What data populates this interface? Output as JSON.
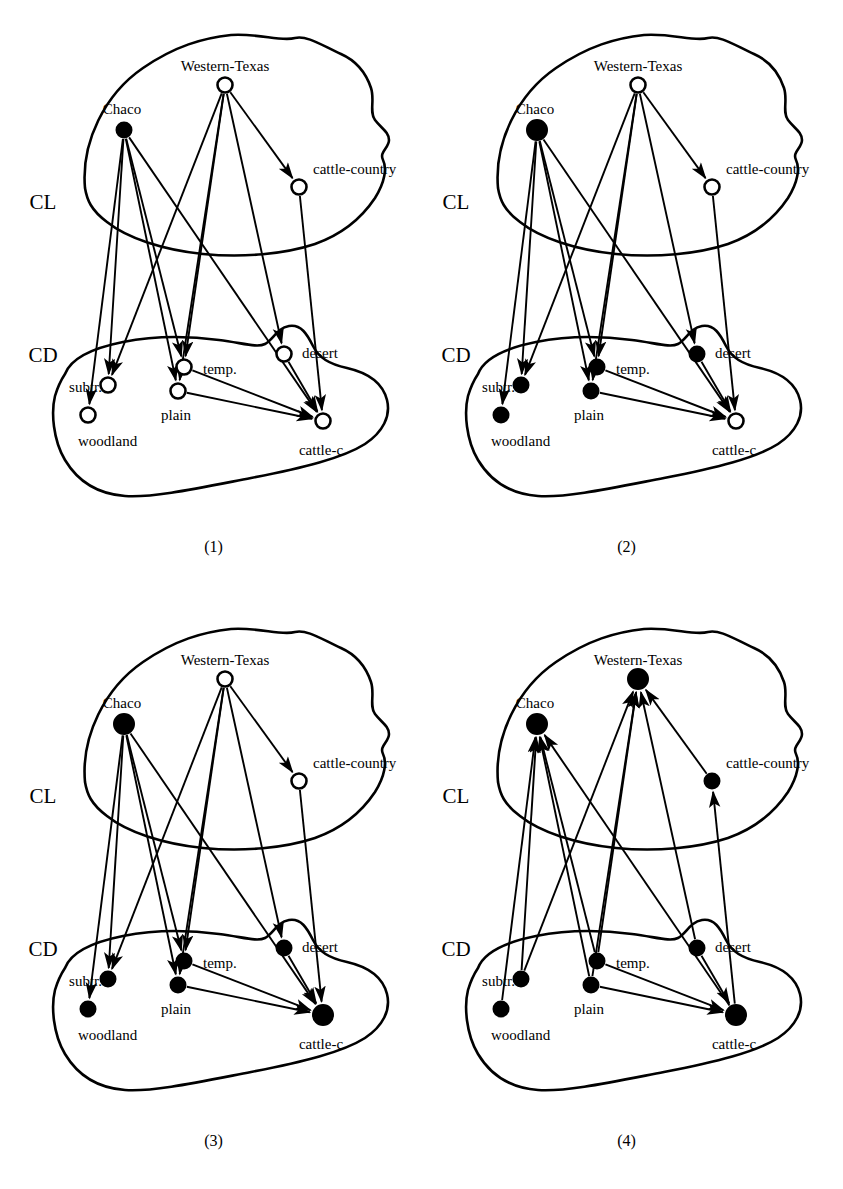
{
  "figure": {
    "title": "",
    "panel_count": 4,
    "region_labels": {
      "upper": "CL",
      "lower": "CD"
    },
    "node_states": {
      "hollow": "open circle (unmarked concept)",
      "filled": "solid black circle (marked concept)"
    }
  },
  "nodes": {
    "western_texas": "Western-Texas",
    "chaco": "Chaco",
    "cattle_country": "cattle-country",
    "subtr": "subtr.",
    "temp": "temp.",
    "desert": "desert",
    "woodland": "woodland",
    "plain": "plain",
    "cattle_c": "cattle-c"
  },
  "panels": [
    {
      "caption": "(1)",
      "region_upper": "CL",
      "region_lower": "CD",
      "labels": {
        "western_texas": "Western-Texas",
        "chaco": "Chaco",
        "cattle_country": "cattle-country",
        "subtr": "subtr.",
        "temp": "temp.",
        "desert": "desert",
        "woodland": "woodland",
        "plain": "plain",
        "cattle_c": "cattle-c"
      },
      "filled": [
        "chaco"
      ],
      "hollow": [
        "western_texas",
        "cattle_country",
        "subtr",
        "temp",
        "desert",
        "woodland",
        "plain",
        "cattle_c"
      ],
      "arrow_direction": "downward",
      "big_node": "none"
    },
    {
      "caption": "(2)",
      "region_upper": "CL",
      "region_lower": "CD",
      "labels": {
        "western_texas": "Western-Texas",
        "chaco": "Chaco",
        "cattle_country": "cattle-country",
        "subtr": "subtr.",
        "temp": "temp.",
        "desert": "desert",
        "woodland": "woodland",
        "plain": "plain",
        "cattle_c": "cattle-c"
      },
      "filled": [
        "chaco",
        "subtr",
        "temp",
        "desert",
        "woodland",
        "plain"
      ],
      "hollow": [
        "western_texas",
        "cattle_country",
        "cattle_c"
      ],
      "arrow_direction": "downward",
      "big_node": "chaco"
    },
    {
      "caption": "(3)",
      "region_upper": "CL",
      "region_lower": "CD",
      "labels": {
        "western_texas": "Western-Texas",
        "chaco": "Chaco",
        "cattle_country": "cattle-country",
        "subtr": "subtr.",
        "temp": "temp.",
        "desert": "desert",
        "woodland": "woodland",
        "plain": "plain",
        "cattle_c": "cattle-c"
      },
      "filled": [
        "chaco",
        "subtr",
        "temp",
        "desert",
        "woodland",
        "plain",
        "cattle_c"
      ],
      "hollow": [
        "western_texas",
        "cattle_country"
      ],
      "arrow_direction": "downward",
      "big_node": "chaco,cattle_c"
    },
    {
      "caption": "(4)",
      "region_upper": "CL",
      "region_lower": "CD",
      "labels": {
        "western_texas": "Western-Texas",
        "chaco": "Chaco",
        "cattle_country": "cattle-country",
        "subtr": "subtr.",
        "temp": "temp.",
        "desert": "desert",
        "woodland": "woodland",
        "plain": "plain",
        "cattle_c": "cattle-c"
      },
      "filled": [
        "chaco",
        "western_texas",
        "cattle_country",
        "subtr",
        "temp",
        "desert",
        "woodland",
        "plain",
        "cattle_c"
      ],
      "hollow": [],
      "arrow_direction": "upward",
      "big_node": "western_texas,chaco,cattle_c"
    }
  ],
  "edges": {
    "cl_internal": [
      {
        "from": "western_texas",
        "to": "cattle_country"
      }
    ],
    "cross_cl_to_cd": [
      {
        "from": "chaco",
        "to": "woodland"
      },
      {
        "from": "chaco",
        "to": "subtr"
      },
      {
        "from": "chaco",
        "to": "plain"
      },
      {
        "from": "chaco",
        "to": "temp"
      },
      {
        "from": "chaco",
        "to": "cattle_c"
      },
      {
        "from": "western_texas",
        "to": "subtr"
      },
      {
        "from": "western_texas",
        "to": "plain"
      },
      {
        "from": "western_texas",
        "to": "temp"
      },
      {
        "from": "western_texas",
        "to": "desert"
      },
      {
        "from": "cattle_country",
        "to": "cattle_c"
      }
    ],
    "cd_internal": [
      {
        "from": "temp",
        "to": "cattle_c"
      },
      {
        "from": "plain",
        "to": "cattle_c"
      },
      {
        "from": "desert",
        "to": "cattle_c"
      }
    ]
  }
}
